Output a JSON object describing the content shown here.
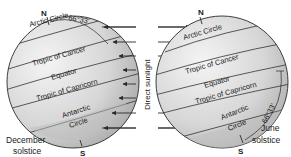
{
  "diagram": {
    "title": "",
    "center_label": "Direct sunlight",
    "colors": {
      "globe_light": "#f2f2f2",
      "globe_mid": "#cfcfcf",
      "globe_dark": "#9a9a9a",
      "line": "#2a2a2a",
      "text": "#1a1a1a"
    },
    "left_globe": {
      "caption_line1": "December",
      "caption_line2": "solstice",
      "north_label": "N",
      "south_label": "S",
      "angle_label": "66°33'",
      "latitudes": {
        "arctic": "Arctic Circle",
        "cancer": "Tropic of Cancer",
        "equator": "Equator",
        "capricorn": "Tropic of Capricorn",
        "antarctic_line1": "Antarctic",
        "antarctic_line2": "Circle"
      }
    },
    "right_globe": {
      "caption_line1": "June",
      "caption_line2": "solstice",
      "north_label": "N",
      "south_label": "S",
      "angle_label": "66°33'",
      "latitudes": {
        "arctic": "Arctic Circle",
        "cancer": "Tropic of Cancer",
        "equator": "Equator",
        "capricorn": "Tropic of Capricorn",
        "antarctic_line1": "Antarctic",
        "antarctic_line2": "Circle"
      }
    },
    "arrows": {
      "left_direction": "left",
      "right_direction": "right",
      "count_per_side": 8
    }
  }
}
